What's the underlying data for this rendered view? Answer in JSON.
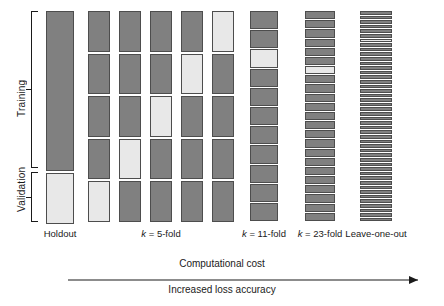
{
  "axis": {
    "training_label": "Training",
    "validation_label": "Validation"
  },
  "colors": {
    "training_block": "#808080",
    "validation_block": "#e8e8e8",
    "block_border": "#4d4d4d",
    "line": "#1a1a1a",
    "background": "#ffffff"
  },
  "legend_meaning": {
    "dark": "training fold",
    "light": "validation fold"
  },
  "chart_data": {
    "type": "diagram",
    "title": "",
    "schemes": [
      {
        "id": "holdout",
        "label": "Holdout",
        "label_prefix": "",
        "k": 1,
        "n_blocks": 2,
        "validation_indices": [
          2
        ],
        "block_pattern": [
          "train",
          "valid"
        ],
        "proportions": [
          0.76,
          0.24
        ]
      },
      {
        "id": "kfold5-col1",
        "label": "k = 5-fold",
        "label_prefix": "k",
        "k": 5,
        "n_blocks": 5,
        "validation_indices": [
          5
        ],
        "block_pattern": [
          "train",
          "train",
          "train",
          "train",
          "valid"
        ]
      },
      {
        "id": "kfold5-col2",
        "label": "",
        "k": 5,
        "n_blocks": 5,
        "validation_indices": [
          4
        ],
        "block_pattern": [
          "train",
          "train",
          "train",
          "valid",
          "train"
        ]
      },
      {
        "id": "kfold5-col3",
        "label": "",
        "k": 5,
        "n_blocks": 5,
        "validation_indices": [
          3
        ],
        "block_pattern": [
          "train",
          "train",
          "valid",
          "train",
          "train"
        ]
      },
      {
        "id": "kfold5-col4",
        "label": "",
        "k": 5,
        "n_blocks": 5,
        "validation_indices": [
          2
        ],
        "block_pattern": [
          "train",
          "valid",
          "train",
          "train",
          "train"
        ]
      },
      {
        "id": "kfold5-col5",
        "label": "",
        "k": 5,
        "n_blocks": 5,
        "validation_indices": [
          1
        ],
        "block_pattern": [
          "valid",
          "train",
          "train",
          "train",
          "train"
        ]
      },
      {
        "id": "kfold11",
        "label": "k = 11-fold",
        "label_prefix": "k",
        "k": 11,
        "n_blocks": 11,
        "validation_indices": [
          3
        ]
      },
      {
        "id": "kfold23",
        "label": "k = 23-fold",
        "label_prefix": "k",
        "k": 23,
        "n_blocks": 23,
        "validation_indices": [
          7
        ]
      },
      {
        "id": "leave-one-out",
        "label": "Leave-one-out",
        "label_prefix": "",
        "k": 46,
        "n_blocks": 46,
        "validation_indices": [
          7
        ]
      }
    ],
    "labels": {
      "holdout": "Holdout",
      "kfold5": "k = 5-fold",
      "kfold11": "k = 11-fold",
      "kfold23": "k = 23-fold",
      "loo": "Leave-one-out"
    },
    "axis_arrow": {
      "caption_above": "Computational cost",
      "caption_below": "Increased loss accuracy",
      "direction": "left-to-right"
    }
  }
}
